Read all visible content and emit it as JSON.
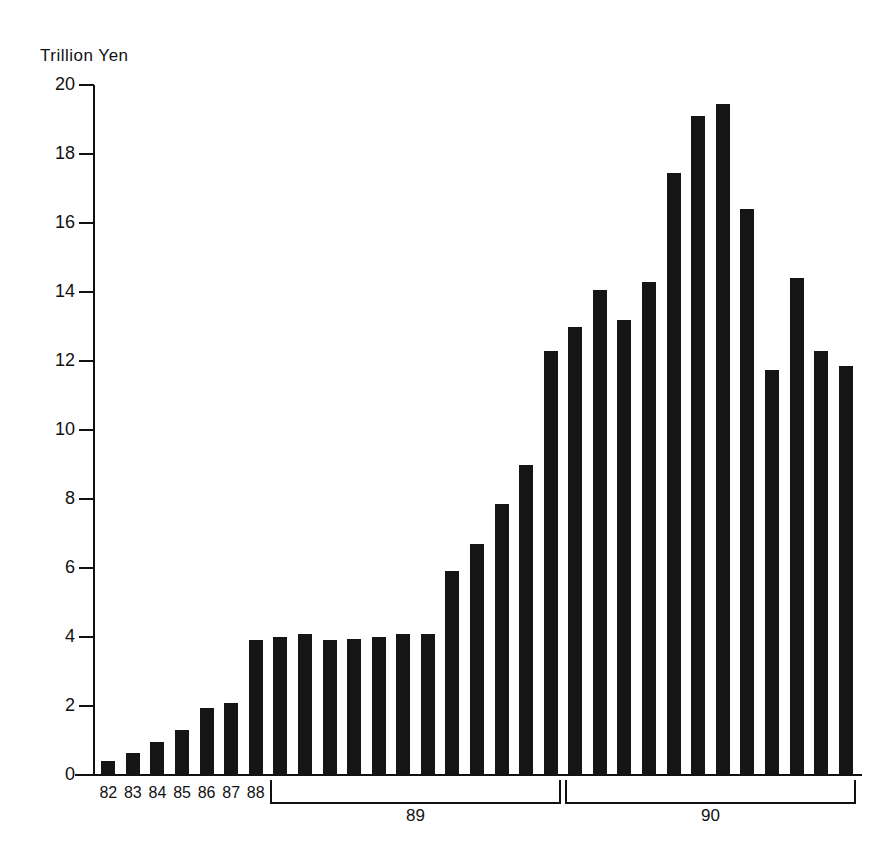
{
  "chart_data": {
    "type": "bar",
    "title": "",
    "subtitle": "",
    "unit_label": "Trillion  Yen",
    "xlabel": "",
    "ylabel": "Trillion Yen",
    "ylim": [
      0,
      20
    ],
    "ytick_step": 2,
    "yticks": [
      20,
      18,
      16,
      14,
      12,
      10,
      8,
      6,
      4,
      2,
      0
    ],
    "ytick_labels": [
      "20",
      "18",
      "16",
      "14",
      "12",
      "10",
      "8",
      "6",
      "4",
      "2",
      "0"
    ],
    "grid": false,
    "legend": null,
    "bar_color": "#151515",
    "axis_color": "#111111",
    "background": "#ffffff",
    "n_bars": 31,
    "categories": [
      "82",
      "83",
      "84",
      "85",
      "86",
      "87",
      "88",
      "89-1",
      "89-2",
      "89-3",
      "89-4",
      "89-5",
      "89-6",
      "89-7",
      "89-8",
      "89-9",
      "89-10",
      "89-11",
      "89-12",
      "90-1",
      "90-2",
      "90-3",
      "90-4",
      "90-5",
      "90-6",
      "90-7",
      "90-8",
      "90-9",
      "90-10",
      "90-11",
      "90-12"
    ],
    "values": [
      0.4,
      0.65,
      0.95,
      1.3,
      1.95,
      2.1,
      3.9,
      4.0,
      4.1,
      3.9,
      3.95,
      4.0,
      4.1,
      4.1,
      5.9,
      6.7,
      7.85,
      9.0,
      12.3,
      13.0,
      14.05,
      13.2,
      14.3,
      17.45,
      19.1,
      19.45,
      16.4,
      11.75,
      14.4,
      12.3,
      11.85
    ],
    "x_tick_labels": [
      {
        "label": "82",
        "bar_index": 0
      },
      {
        "label": "83",
        "bar_index": 1
      },
      {
        "label": "84",
        "bar_index": 2
      },
      {
        "label": "85",
        "bar_index": 3
      },
      {
        "label": "86",
        "bar_index": 4
      },
      {
        "label": "87",
        "bar_index": 5
      },
      {
        "label": "88",
        "bar_index": 6
      }
    ],
    "group_brackets": [
      {
        "label": "89",
        "start_bar": 7,
        "end_bar": 18
      },
      {
        "label": "90",
        "start_bar": 19,
        "end_bar": 30
      }
    ]
  }
}
